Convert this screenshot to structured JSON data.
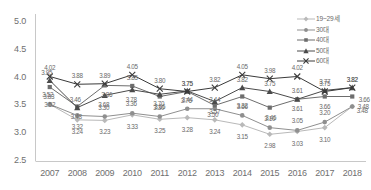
{
  "chart_data": {
    "type": "line",
    "title": "",
    "xlabel": "",
    "ylabel": "",
    "categories": [
      "2007",
      "2008",
      "2009",
      "2010",
      "2011",
      "2012",
      "2013",
      "2014",
      "2015",
      "2016",
      "2017",
      "2018"
    ],
    "ylim": [
      2.5,
      5.0
    ],
    "ytick_labels": [
      "5.0",
      "4.5",
      "4.0",
      "3.5",
      "3.0",
      "2.5"
    ],
    "ytick_values": [
      5.0,
      4.5,
      4.0,
      3.5,
      3.0,
      2.5
    ],
    "grid": false,
    "legend_position": "top-right",
    "series": [
      {
        "name": "19~29세",
        "marker": "diamond",
        "color": "#b9b9b9",
        "values": [
          3.52,
          3.24,
          3.23,
          3.33,
          3.25,
          3.28,
          3.24,
          3.15,
          2.98,
          3.03,
          3.1,
          3.48
        ],
        "labels": [
          "3.52",
          "3.24",
          "3.23",
          "3.33",
          "3.25",
          "3.28",
          "3.24",
          "3.15",
          "2.98",
          "3.03",
          "3.10",
          "3.48"
        ]
      },
      {
        "name": "30대",
        "marker": "circle",
        "color": "#8f8f8f",
        "values": [
          3.52,
          3.32,
          3.3,
          3.36,
          3.3,
          3.44,
          3.44,
          3.32,
          3.1,
          3.05,
          3.2,
          3.48
        ],
        "labels": [
          "3.52",
          "3.32",
          "3.30",
          "3.36",
          "3.30",
          "3.44",
          "3.44",
          "3.32",
          "3.10",
          "3.05",
          "3.20",
          "3.48"
        ]
      },
      {
        "name": "40대",
        "marker": "square",
        "color": "#6d6d6d",
        "values": [
          3.83,
          3.48,
          3.86,
          3.85,
          3.66,
          3.75,
          3.5,
          3.66,
          3.46,
          3.61,
          3.66,
          3.66
        ],
        "labels": [
          "3.83",
          "3.48",
          "3.86",
          "3.85",
          "3.66",
          "3.75",
          "3.50",
          "3.66",
          "3.46",
          "3.61",
          "3.66",
          "3.66"
        ]
      },
      {
        "name": "50대",
        "marker": "triangle",
        "color": "#4a4a4a",
        "values": [
          3.95,
          3.46,
          3.68,
          3.78,
          3.7,
          3.76,
          3.57,
          3.82,
          3.75,
          3.61,
          3.77,
          3.82
        ],
        "labels": [
          "3.95",
          "3.46",
          "3.68",
          "3.78",
          "3.70",
          "3.76",
          "3.57",
          "3.82",
          "3.75",
          "3.61",
          "3.77",
          "3.82"
        ]
      },
      {
        "name": "60대",
        "marker": "cross",
        "color": "#3a3a3a",
        "values": [
          4.02,
          3.88,
          3.89,
          4.05,
          3.8,
          3.75,
          3.82,
          4.05,
          3.98,
          4.02,
          3.75,
          3.82
        ],
        "labels": [
          "4.02",
          "3.88",
          "3.89",
          "4.05",
          "3.80",
          "3.75",
          "3.82",
          "4.05",
          "3.98",
          "4.02",
          "3.75",
          "3.82"
        ]
      }
    ],
    "label_offsets": {
      "19~29세": [
        [
          -2,
          -10
        ],
        [
          0,
          11
        ],
        [
          0,
          11
        ],
        [
          0,
          11
        ],
        [
          0,
          11
        ],
        [
          0,
          11
        ],
        [
          0,
          11
        ],
        [
          0,
          11
        ],
        [
          0,
          11
        ],
        [
          0,
          11
        ],
        [
          0,
          11
        ],
        [
          10,
          3
        ]
      ],
      "30대": [
        [
          0,
          0
        ],
        [
          0,
          11
        ],
        [
          -1,
          -10
        ],
        [
          -1,
          -10
        ],
        [
          -1,
          -10
        ],
        [
          0,
          -10
        ],
        [
          0,
          -10
        ],
        [
          0,
          -10
        ],
        [
          0,
          -10
        ],
        [
          0,
          -10
        ],
        [
          0,
          -10
        ],
        [
          11,
          -1
        ]
      ],
      "40대": [
        [
          -1,
          9
        ],
        [
          -1,
          9
        ],
        [
          2,
          9
        ],
        [
          0,
          -9
        ],
        [
          0,
          9
        ],
        [
          0,
          -9
        ],
        [
          -2,
          9
        ],
        [
          0,
          9
        ],
        [
          1,
          9
        ],
        [
          0,
          9
        ],
        [
          0,
          9
        ],
        [
          12,
          2
        ]
      ],
      "50대": [
        [
          -3,
          -8
        ],
        [
          -2,
          -9
        ],
        [
          -1,
          9
        ],
        [
          -1,
          9
        ],
        [
          -1,
          9
        ],
        [
          -1,
          9
        ],
        [
          0,
          9
        ],
        [
          0,
          -9
        ],
        [
          0,
          -9
        ],
        [
          0,
          -9
        ],
        [
          0,
          -9
        ],
        [
          0,
          -9
        ]
      ],
      "60대": [
        [
          0,
          -9
        ],
        [
          0,
          -9
        ],
        [
          0,
          -9
        ],
        [
          0,
          -9
        ],
        [
          0,
          -9
        ],
        [
          0,
          -9
        ],
        [
          0,
          -9
        ],
        [
          0,
          -9
        ],
        [
          0,
          -9
        ],
        [
          0,
          -9
        ],
        [
          0,
          -9
        ],
        [
          0,
          -9
        ]
      ]
    }
  },
  "axes": {
    "y_axis_name": "value-axis",
    "x_axis_name": "year-axis"
  }
}
